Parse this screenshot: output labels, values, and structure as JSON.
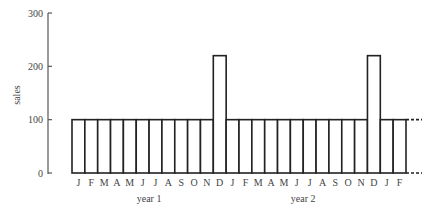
{
  "chart_data": {
    "type": "bar",
    "title": "",
    "xlabel": "",
    "ylabel": "sales",
    "ylim": [
      0,
      300
    ],
    "yticks": [
      0,
      100,
      200,
      300
    ],
    "grid": false,
    "legend": null,
    "categories": [
      "J",
      "F",
      "M",
      "A",
      "M",
      "J",
      "J",
      "A",
      "S",
      "O",
      "N",
      "D",
      "J",
      "F",
      "M",
      "A",
      "M",
      "J",
      "J",
      "A",
      "S",
      "O",
      "N",
      "D",
      "J",
      "F"
    ],
    "groups": [
      {
        "label": "year 1",
        "start": 0,
        "end": 11
      },
      {
        "label": "year 2",
        "start": 12,
        "end": 23
      }
    ],
    "values": [
      100,
      100,
      100,
      100,
      100,
      100,
      100,
      100,
      100,
      100,
      100,
      220,
      100,
      100,
      100,
      100,
      100,
      100,
      100,
      100,
      100,
      100,
      100,
      220,
      100,
      100
    ],
    "annotations": [
      "dashed continuation lines at 0 and 100 beyond final bar"
    ],
    "colors": {
      "bar_fill": "#ffffff",
      "bar_stroke": "#222222",
      "axis": "#555555"
    }
  }
}
